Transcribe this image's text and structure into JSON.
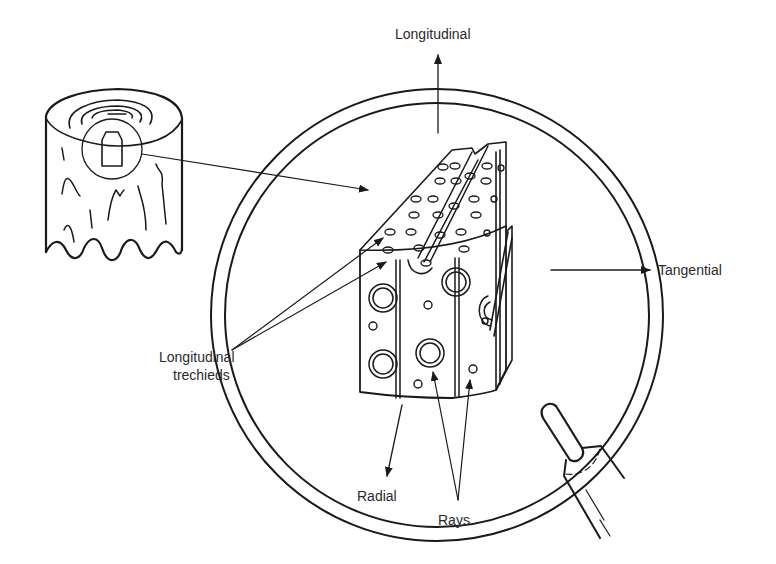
{
  "figure": {
    "type": "wood-structure-illustration",
    "labels": {
      "longitudinal": "Longitudinal",
      "tangential": "Tangential",
      "radial": "Radial",
      "rays": "Rays",
      "tracheids_line1": "Longitudinal",
      "tracheids_line2": "trechieds"
    },
    "elements": [
      "tree-stump with growth rings and highlighted sample block",
      "pointer arrow from stump sample to magnified block",
      "magnifying glass lens (double ring) with handle",
      "magnified wood block showing longitudinal tracheids, pits and rays",
      "axis arrows: longitudinal (up), tangential (right), radial (down-left)"
    ],
    "colors": {
      "ink": "#1a1a1a",
      "text": "#2a2a2a",
      "background": "#ffffff"
    }
  }
}
